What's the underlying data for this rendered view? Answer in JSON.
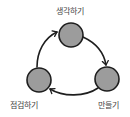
{
  "diagram": {
    "type": "cycle",
    "colors": {
      "node_fill": "#9c9c9c",
      "node_stroke": "#1e1e1e",
      "arrow": "#1e1e1e",
      "label": "#444444"
    },
    "nodes": [
      {
        "id": "think",
        "label": "생각하기",
        "cx": 71,
        "cy": 35,
        "r": 12
      },
      {
        "id": "make",
        "label": "만들기",
        "cx": 107,
        "cy": 79,
        "r": 12
      },
      {
        "id": "check",
        "label": "점검하기",
        "cx": 39,
        "cy": 80,
        "r": 12
      }
    ],
    "edges": [
      {
        "from": "think",
        "to": "make"
      },
      {
        "from": "make",
        "to": "check"
      },
      {
        "from": "check",
        "to": "think"
      }
    ]
  }
}
